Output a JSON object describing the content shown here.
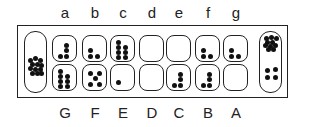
{
  "top_labels": [
    "a",
    "b",
    "c",
    "d",
    "e",
    "f",
    "g"
  ],
  "bottom_labels": [
    "G",
    "F",
    "E",
    "D",
    "C",
    "B",
    "A"
  ],
  "top_pits": [
    4,
    3,
    7,
    0,
    0,
    3,
    3
  ],
  "bottom_pits": [
    7,
    5,
    1,
    0,
    4,
    4,
    0
  ],
  "left_store": 12,
  "right_store": 14,
  "colors": {
    "line": "#222222",
    "seed": "#111111"
  }
}
